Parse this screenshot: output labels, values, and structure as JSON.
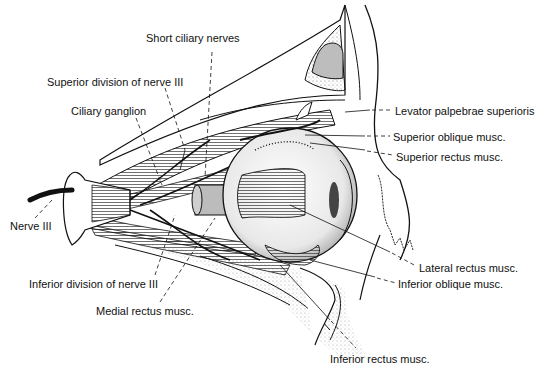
{
  "diagram": {
    "labels": [
      {
        "id": "short-ciliary-nerves",
        "text": "Short ciliary nerves",
        "x": 146,
        "y": 38
      },
      {
        "id": "superior-division-nerve-iii",
        "text": "Superior division of nerve III",
        "x": 47,
        "y": 76
      },
      {
        "id": "ciliary-ganglion",
        "text": "Ciliary ganglion",
        "x": 71,
        "y": 105
      },
      {
        "id": "levator-palpebrae-superioris",
        "text": "Levator palpebrae superioris",
        "x": 395,
        "y": 105
      },
      {
        "id": "superior-oblique-musc",
        "text": "Superior oblique musc.",
        "x": 393,
        "y": 131
      },
      {
        "id": "superior-rectus-musc",
        "text": "Superior rectus musc.",
        "x": 396,
        "y": 150
      },
      {
        "id": "nerve-iii",
        "text": "Nerve III",
        "x": 10,
        "y": 222
      },
      {
        "id": "lateral-rectus-musc",
        "text": "Lateral rectus musc.",
        "x": 419,
        "y": 262
      },
      {
        "id": "inferior-oblique-musc",
        "text": "Inferior oblique musc.",
        "x": 398,
        "y": 278
      },
      {
        "id": "inferior-division-nerve-iii",
        "text": "Inferior division of nerve III",
        "x": 29,
        "y": 278
      },
      {
        "id": "medial-rectus-musc",
        "text": "Medial rectus musc.",
        "x": 96,
        "y": 305
      },
      {
        "id": "inferior-rectus-musc",
        "text": "Inferior rectus musc.",
        "x": 330,
        "y": 353
      }
    ],
    "colors": {
      "ink": "#111111",
      "background": "#ffffff",
      "shade": "#9a9a9a",
      "light_shade": "#d6d6d6"
    }
  }
}
